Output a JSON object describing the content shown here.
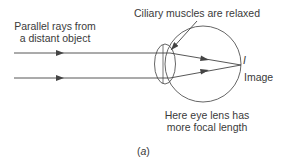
{
  "diagram": {
    "labels": {
      "rays_line1": "Parallel rays from",
      "rays_line2": "a distant object",
      "muscles": "Ciliary muscles are relaxed",
      "image_symbol": "I",
      "image": "Image",
      "lens_line1": "Here eye lens has",
      "lens_line2": "more focal length",
      "caption": "(a)"
    },
    "colors": {
      "stroke": "#444444",
      "text": "#3a3a3a",
      "background": "#ffffff"
    }
  }
}
